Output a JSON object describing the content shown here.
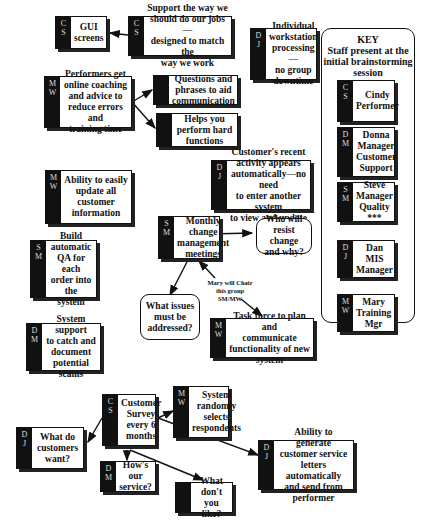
{
  "key": {
    "title": "KEY\nStaff present at the\ninitial brainstorming\nsession",
    "members": [
      {
        "initials": "C\nS",
        "label": "Cindy\nPerformer"
      },
      {
        "initials": "D\nM",
        "label": "Donna\nManager\nCustomer\nSupport"
      },
      {
        "initials": "S\nM",
        "label": "Steve\nManager\nQuality\n***"
      },
      {
        "initials": "D\nJ",
        "label": "Dan\nMIS\nManager"
      },
      {
        "initials": "M\nW",
        "label": "Mary\nTraining\nMgr"
      }
    ]
  },
  "nodes": {
    "gui": {
      "initials": "C\nS",
      "label": "GUI\nscreens"
    },
    "support_way": {
      "initials": "C\nS",
      "label": "Support the way we\nshould do our jobs—\ndesigned to match the\nway we work"
    },
    "individual": {
      "initials": "D\nJ",
      "label": "Individual\nworkstation\nprocessing—\nno group\ndowntime"
    },
    "performers": {
      "initials": "M\nW",
      "label": "Performers get\nonline coaching\nand advice to\nreduce errors and\ntraining time"
    },
    "questions": {
      "initials": "",
      "label": "Questions and\nphrases to aid\ncommunication"
    },
    "helps": {
      "initials": "",
      "label": "Helps you\nperform hard\nfunctions"
    },
    "update": {
      "initials": "M\nW",
      "label": "Ability to easily\nupdate all customer\ninformation"
    },
    "recent": {
      "initials": "D\nJ",
      "label": "Customer's recent\nactivity appears\nautomatically—no need\nto enter another system\nto view and update"
    },
    "monthly": {
      "initials": "S\nM",
      "label": "Monthly\nchange\nmanagement\nmeetings"
    },
    "resist": {
      "label": "Who will\nresist change\nand why?"
    },
    "build_qa": {
      "initials": "S\nM",
      "label": "Build\nautomatic\nQA for each\norder into the\nsystem"
    },
    "issues": {
      "label": "What issues\nmust be\naddressed?"
    },
    "task_force": {
      "initials": "M\nW",
      "label": "Task force to plan and\ncommunicate\nfunctionality of new\nsystem"
    },
    "scams": {
      "initials": "D\nM",
      "label": "System support\nto catch and\ndocument\npotential scams"
    },
    "survey": {
      "initials": "C\nS",
      "label": "Customer\nSurvey\nevery 6\nmonths"
    },
    "random": {
      "initials": "M\nW",
      "label": "System\nrandomly\nselects\nrespondents"
    },
    "want": {
      "initials": "D\nJ",
      "label": "What do\ncustomers\nwant?"
    },
    "hows": {
      "initials": "D\nM",
      "label": "How's our\nservice?"
    },
    "letters": {
      "initials": "D\nJ",
      "label": "Ability to generate\ncustomer service\nletters automatically\nand send from\nperformer"
    },
    "dont_like": {
      "initials": "",
      "label": "What don't\nyou like?"
    }
  },
  "annotations": {
    "mary_chair": "Mary will Chair\nthis group\nSM/MW"
  }
}
